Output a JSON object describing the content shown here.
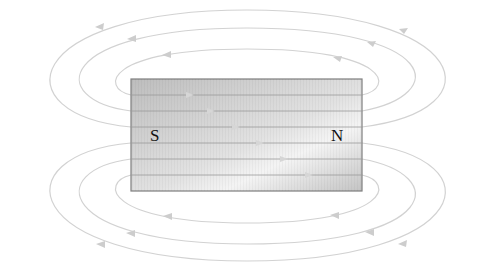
{
  "diagram": {
    "magnet": {
      "x": 131,
      "y": 79,
      "width": 231,
      "height": 112,
      "fill_light": "#e6e6e6",
      "fill_dark": "#b9b9b9",
      "border": "#8a8a8a"
    },
    "poles": {
      "south_label": "S",
      "north_label": "N"
    },
    "field_line_color": "#cfcfcf",
    "internal_lines_y": [
      95,
      111,
      127,
      143,
      159,
      175
    ],
    "direction": "Field lines exit N pole, loop around, re-enter S pole; inside magnet flow S to N"
  }
}
